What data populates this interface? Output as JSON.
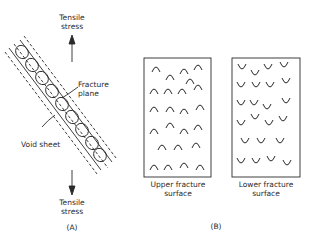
{
  "panel_a": {
    "top_label_line1": "Tensile",
    "top_label_line2": "stress",
    "bottom_label_line1": "Tensile",
    "bottom_label_line2": "stress",
    "fracture_label_line1": "Fracture",
    "fracture_label_line2": "plane",
    "void_label": "Void sheet",
    "panel_label": "(A)"
  },
  "panel_b": {
    "upper_label_line1": "Upper fracture",
    "upper_label_line2": "surface",
    "lower_label_line1": "Lower fracture",
    "lower_label_line2": "surface",
    "panel_label": "(B)"
  },
  "colors": {
    "ink": "#2a2a2a",
    "background": "#ffffff"
  }
}
